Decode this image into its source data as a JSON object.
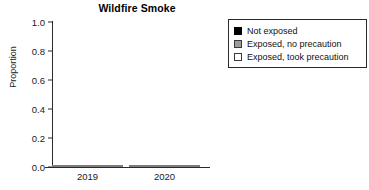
{
  "chart_data": {
    "type": "bar",
    "title": "Wildfire Smoke",
    "xlabel": "",
    "ylabel": "Proportion",
    "categories": [
      "2019",
      "2020"
    ],
    "stacked": true,
    "ylim": [
      0.0,
      1.0
    ],
    "yticks": [
      "0.0",
      "0.2",
      "0.4",
      "0.6",
      "0.8",
      "1.0"
    ],
    "ytick_values": [
      0.0,
      0.2,
      0.4,
      0.6,
      0.8,
      1.0
    ],
    "grid": false,
    "legend_position": "right",
    "series": [
      {
        "name": "Not exposed",
        "color": "#000000",
        "values": [
          0.5,
          0.31
        ]
      },
      {
        "name": "Exposed, no precaution",
        "color": "#9d9d9d",
        "values": [
          0.22,
          0.24
        ]
      },
      {
        "name": "Exposed, took precaution",
        "color": "#d9d9d9",
        "values": [
          0.28,
          0.45
        ]
      }
    ]
  },
  "title": "Wildfire Smoke",
  "axes": {
    "y_label": "Proportion",
    "y_ticks": [
      {
        "label": "1.0",
        "value": 1.0
      },
      {
        "label": "0.8",
        "value": 0.8
      },
      {
        "label": "0.6",
        "value": 0.6
      },
      {
        "label": "0.4",
        "value": 0.4
      },
      {
        "label": "0.2",
        "value": 0.2
      },
      {
        "label": "0.0",
        "value": 0.0
      }
    ],
    "x_ticks": [
      {
        "label": "2019"
      },
      {
        "label": "2020"
      }
    ]
  },
  "bars": [
    {
      "category": "2019",
      "segments": [
        {
          "series": "Exposed, took precaution",
          "value": 0.28,
          "top": 1.0,
          "bottom": 0.72
        },
        {
          "series": "Exposed, no precaution",
          "value": 0.22,
          "top": 0.72,
          "bottom": 0.5
        },
        {
          "series": "Not exposed",
          "value": 0.5,
          "top": 0.5,
          "bottom": 0.0
        }
      ]
    },
    {
      "category": "2020",
      "segments": [
        {
          "series": "Exposed, took precaution",
          "value": 0.45,
          "top": 1.0,
          "bottom": 0.55
        },
        {
          "series": "Exposed, no precaution",
          "value": 0.24,
          "top": 0.55,
          "bottom": 0.31
        },
        {
          "series": "Not exposed",
          "value": 0.31,
          "top": 0.31,
          "bottom": 0.0
        }
      ]
    }
  ],
  "legend": {
    "items": [
      {
        "label": "Not exposed",
        "swatch": "dark",
        "color": "#000000"
      },
      {
        "label": "Exposed, no precaution",
        "swatch": "mid",
        "color": "#9d9d9d"
      },
      {
        "label": "Exposed, took precaution",
        "swatch": "light",
        "color": "#ffffff"
      }
    ]
  }
}
